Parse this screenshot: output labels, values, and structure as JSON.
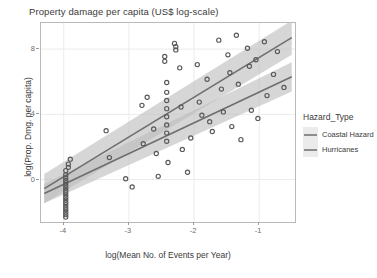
{
  "chart_data": {
    "type": "scatter",
    "title": "Property damage per capita (US$ log-scale)",
    "xlabel": "log(Mean No. of Events per Year)",
    "ylabel": "log(Prop. Dmg. per capita)",
    "xlim": [
      -4.35,
      -0.45
    ],
    "ylim": [
      -2.6,
      9.6
    ],
    "xticks": [
      -4,
      -3,
      -2,
      -1
    ],
    "xticklabels": [
      "-4",
      "-3",
      "-2",
      "-1"
    ],
    "yticks": [
      0,
      4,
      8
    ],
    "yticklabels": [
      "0",
      "4",
      "8"
    ],
    "grid": true,
    "grid_color": "#ebebeb",
    "panel_background": "#ffffff",
    "panel_border_color": "#b9b9b9",
    "point_shape": "open-circle",
    "point_color": "#595959",
    "legend": {
      "title": "Hazard_Type",
      "position": "right",
      "entries": [
        {
          "label": "Coastal Hazard",
          "color": "#8c8c8c"
        },
        {
          "label": "Hurricanes",
          "color": "#8c8c8c"
        }
      ]
    },
    "series": [
      {
        "name": "Coastal Hazard",
        "fit": {
          "type": "linear",
          "line_color": "#6e6e6e",
          "ribbon_color": "#bdbdbd",
          "x": [
            -4.3,
            -0.5
          ],
          "y": [
            -0.55,
            8.7
          ],
          "ci_upper": [
            0.35,
            9.75
          ],
          "ci_lower": [
            -1.45,
            7.65
          ]
        }
      },
      {
        "name": "Hurricanes",
        "fit": {
          "type": "linear",
          "line_color": "#6e6e6e",
          "ribbon_color": "#bdbdbd",
          "x": [
            -4.3,
            -0.5
          ],
          "y": [
            -0.85,
            6.3
          ],
          "ci_upper": [
            -0.25,
            7.2
          ],
          "ci_lower": [
            -1.45,
            5.4
          ]
        }
      }
    ],
    "points": [
      [
        -3.97,
        0.55
      ],
      [
        -3.97,
        0.3
      ],
      [
        -3.97,
        0.1
      ],
      [
        -3.97,
        -0.05
      ],
      [
        -3.97,
        -0.2
      ],
      [
        -3.97,
        -0.35
      ],
      [
        -3.97,
        -0.5
      ],
      [
        -3.97,
        -0.65
      ],
      [
        -3.97,
        -0.8
      ],
      [
        -3.97,
        -0.95
      ],
      [
        -3.97,
        -1.1
      ],
      [
        -3.97,
        -1.25
      ],
      [
        -3.97,
        -1.4
      ],
      [
        -3.97,
        -1.55
      ],
      [
        -3.97,
        -1.7
      ],
      [
        -3.97,
        -1.85
      ],
      [
        -3.97,
        -2.0
      ],
      [
        -3.97,
        -2.15
      ],
      [
        -3.97,
        -2.3
      ],
      [
        -3.93,
        0.95
      ],
      [
        -3.93,
        0.75
      ],
      [
        -3.9,
        1.25
      ],
      [
        -3.35,
        3.0
      ],
      [
        -3.3,
        1.35
      ],
      [
        -3.05,
        0.05
      ],
      [
        -2.95,
        -0.45
      ],
      [
        -2.8,
        4.55
      ],
      [
        -2.78,
        2.2
      ],
      [
        -2.72,
        5.05
      ],
      [
        -2.62,
        3.1
      ],
      [
        -2.58,
        1.6
      ],
      [
        -2.55,
        0.2
      ],
      [
        -2.45,
        7.55
      ],
      [
        -2.45,
        7.25
      ],
      [
        -2.42,
        5.95
      ],
      [
        -2.42,
        5.35
      ],
      [
        -2.42,
        4.85
      ],
      [
        -2.42,
        4.35
      ],
      [
        -2.42,
        3.85
      ],
      [
        -2.42,
        3.35
      ],
      [
        -2.42,
        2.85
      ],
      [
        -2.42,
        2.35
      ],
      [
        -2.4,
        1.05
      ],
      [
        -2.3,
        8.35
      ],
      [
        -2.28,
        8.15
      ],
      [
        -2.28,
        7.95
      ],
      [
        -2.22,
        6.85
      ],
      [
        -2.2,
        4.45
      ],
      [
        -2.18,
        1.85
      ],
      [
        -2.1,
        0.45
      ],
      [
        -2.05,
        2.55
      ],
      [
        -1.95,
        7.05
      ],
      [
        -1.92,
        4.75
      ],
      [
        -1.88,
        3.95
      ],
      [
        -1.8,
        6.15
      ],
      [
        -1.76,
        3.55
      ],
      [
        -1.72,
        2.95
      ],
      [
        -1.62,
        8.55
      ],
      [
        -1.58,
        5.55
      ],
      [
        -1.55,
        4.15
      ],
      [
        -1.48,
        7.65
      ],
      [
        -1.45,
        6.55
      ],
      [
        -1.42,
        3.25
      ],
      [
        -1.35,
        8.85
      ],
      [
        -1.32,
        5.85
      ],
      [
        -1.28,
        2.45
      ],
      [
        -1.18,
        8.05
      ],
      [
        -1.15,
        6.95
      ],
      [
        -1.12,
        4.25
      ],
      [
        -1.05,
        7.35
      ],
      [
        -1.02,
        3.75
      ],
      [
        -0.92,
        8.45
      ],
      [
        -0.88,
        5.15
      ],
      [
        -0.78,
        6.45
      ],
      [
        -0.72,
        7.85
      ],
      [
        -0.62,
        5.65
      ]
    ]
  }
}
